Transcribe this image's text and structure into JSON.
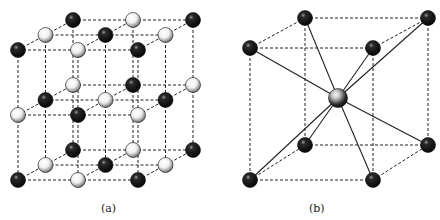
{
  "panels": [
    {
      "id": "a",
      "label": "(a)",
      "structure": "rock-salt lattice (alternating black and white spheres)",
      "origin": [
        18,
        50
      ],
      "a_vec": [
        60,
        0
      ],
      "b_vec": [
        0,
        65
      ],
      "c_vec": [
        27.5,
        -15
      ]
    },
    {
      "id": "b",
      "label": "(b)",
      "structure": "body-centered cubic cell with center atom bonded to 8 corners",
      "front_top_left": [
        250,
        48
      ],
      "front_top_right": [
        373,
        48
      ],
      "back_top_left": [
        305,
        18
      ],
      "back_top_right": [
        428,
        18
      ],
      "front_bottom_left": [
        250,
        180
      ],
      "front_bottom_right": [
        373,
        180
      ],
      "back_bottom_left": [
        305,
        145
      ],
      "back_bottom_right": [
        428,
        145
      ],
      "center": [
        338,
        98
      ]
    }
  ],
  "colors": {
    "black_atom": "#111111",
    "white_atom": "#f4f4f4",
    "line": "#222222"
  }
}
